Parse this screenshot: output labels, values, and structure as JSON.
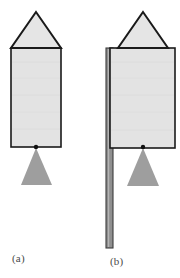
{
  "figure": {
    "background_color": "#ffffff",
    "body_fill": "#e3e3e3",
    "body_stroke": "#1a1a1a",
    "fulcrum_fill": "#9e9e9e",
    "rod_fill": "#8f8f8f",
    "rod_stroke": "#3d3d3d",
    "pivot_color": "#111111",
    "panels": [
      {
        "id": "a",
        "caption": "(a)",
        "nose_cone": {
          "apex_x": 36,
          "apex_y": 12,
          "left_x": 11,
          "right_x": 61,
          "base_y": 48
        },
        "body_rect": {
          "x": 11,
          "y": 48,
          "width": 50,
          "height": 99
        },
        "pivot": {
          "cx": 36,
          "cy": 147,
          "r": 2.2
        },
        "fulcrum": {
          "apex_x": 36,
          "apex_y": 148,
          "left_x": 21,
          "right_x": 52,
          "base_y": 185
        },
        "rod": null
      },
      {
        "id": "b",
        "caption": "(b)",
        "nose_cone": {
          "apex_x": 143,
          "apex_y": 12,
          "left_x": 118,
          "right_x": 168,
          "base_y": 48
        },
        "body_rect": {
          "x": 110,
          "y": 48,
          "width": 65,
          "height": 100
        },
        "pivot": {
          "cx": 143,
          "cy": 147,
          "r": 2.2
        },
        "fulcrum": {
          "apex_x": 143,
          "apex_y": 148,
          "left_x": 127,
          "right_x": 159,
          "base_y": 186
        },
        "rod": {
          "x": 106,
          "y": 48,
          "width": 7,
          "height": 200
        }
      }
    ]
  }
}
